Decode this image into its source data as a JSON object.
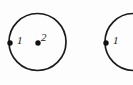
{
  "figure": {
    "background_color": "#fdfdfd",
    "stroke_color": "#1a1a1a",
    "point_color": "#111111",
    "shapes": [
      {
        "name": "circle-1",
        "kind": "circle",
        "center_x": 37.5,
        "center_y": 42,
        "radius": 28.5,
        "stroke_width": 1.6,
        "clipped": false
      },
      {
        "name": "circle-2",
        "kind": "circle",
        "center_x": 133.5,
        "center_y": 42,
        "radius": 28.5,
        "stroke_width": 1.6,
        "clipped": true
      }
    ],
    "points": [
      {
        "name": "point-c1-left",
        "label": "1",
        "x": 10,
        "y": 43,
        "radius": 2.6,
        "on_shape": "circle-1",
        "position": "left edge"
      },
      {
        "name": "point-c1-center",
        "label": "2",
        "x": 38,
        "y": 43,
        "radius": 2.6,
        "on_shape": "circle-1",
        "position": "center"
      },
      {
        "name": "point-c2-left",
        "label": "1",
        "x": 106,
        "y": 43,
        "radius": 2.6,
        "on_shape": "circle-2",
        "position": "left edge"
      }
    ],
    "labels": {
      "circle1_point1": "1",
      "circle1_point2": "2",
      "circle2_point1": "1"
    }
  }
}
